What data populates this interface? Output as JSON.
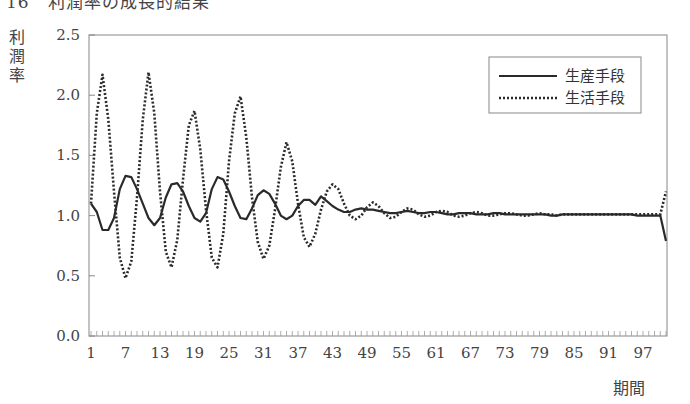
{
  "title": "16　利潤率の成長的結果",
  "chart_data": {
    "type": "line",
    "title": "利潤率の成長的結果",
    "xlabel": "期間",
    "ylabel": "利潤率",
    "ylim": [
      0.0,
      2.5
    ],
    "yticks": [
      "0.0",
      "0.5",
      "1.0",
      "1.5",
      "2.0",
      "2.5"
    ],
    "xticks": [
      "1",
      "7",
      "13",
      "19",
      "25",
      "31",
      "37",
      "43",
      "49",
      "55",
      "61",
      "67",
      "73",
      "79",
      "85",
      "91",
      "97"
    ],
    "xrange": [
      1,
      101
    ],
    "grid": false,
    "legend_position": "upper right",
    "series": [
      {
        "name": "生産手段",
        "style": "solid",
        "values": [
          1.1,
          1.03,
          0.88,
          0.88,
          0.98,
          1.22,
          1.33,
          1.32,
          1.22,
          1.1,
          0.98,
          0.92,
          0.98,
          1.15,
          1.26,
          1.27,
          1.2,
          1.08,
          0.98,
          0.95,
          1.02,
          1.22,
          1.32,
          1.3,
          1.2,
          1.08,
          0.98,
          0.97,
          1.06,
          1.17,
          1.21,
          1.18,
          1.1,
          1.0,
          0.97,
          1.0,
          1.08,
          1.13,
          1.13,
          1.09,
          1.16,
          1.12,
          1.08,
          1.05,
          1.03,
          1.03,
          1.05,
          1.06,
          1.05,
          1.05,
          1.04,
          1.03,
          1.02,
          1.02,
          1.03,
          1.04,
          1.03,
          1.02,
          1.02,
          1.03,
          1.03,
          1.02,
          1.01,
          1.01,
          1.02,
          1.02,
          1.02,
          1.01,
          1.01,
          1.01,
          1.02,
          1.02,
          1.01,
          1.01,
          1.01,
          1.01,
          1.01,
          1.01,
          1.01,
          1.01,
          1.0,
          1.0,
          1.01,
          1.01,
          1.01,
          1.01,
          1.01,
          1.01,
          1.01,
          1.01,
          1.01,
          1.01,
          1.01,
          1.01,
          1.01,
          1.0,
          1.0,
          1.0,
          1.0,
          1.0,
          0.79
        ]
      },
      {
        "name": "生活手段",
        "style": "dotted",
        "values": [
          1.1,
          1.85,
          2.17,
          1.8,
          1.2,
          0.65,
          0.48,
          0.62,
          1.15,
          1.8,
          2.19,
          1.85,
          1.2,
          0.7,
          0.57,
          0.8,
          1.3,
          1.75,
          1.87,
          1.55,
          1.05,
          0.65,
          0.57,
          0.85,
          1.45,
          1.85,
          1.99,
          1.65,
          1.15,
          0.78,
          0.64,
          0.75,
          1.05,
          1.4,
          1.61,
          1.45,
          1.1,
          0.82,
          0.74,
          0.85,
          1.05,
          1.2,
          1.26,
          1.22,
          1.1,
          1.0,
          0.97,
          1.0,
          1.07,
          1.11,
          1.08,
          1.02,
          0.98,
          0.99,
          1.03,
          1.06,
          1.05,
          1.01,
          0.99,
          1.0,
          1.03,
          1.04,
          1.03,
          1.0,
          0.99,
          1.0,
          1.02,
          1.03,
          1.02,
          1.0,
          1.0,
          1.01,
          1.02,
          1.02,
          1.01,
          1.0,
          1.0,
          1.01,
          1.02,
          1.01,
          1.01,
          1.0,
          1.01,
          1.01,
          1.01,
          1.01,
          1.01,
          1.01,
          1.01,
          1.01,
          1.01,
          1.01,
          1.01,
          1.01,
          1.01,
          1.01,
          1.01,
          1.01,
          1.01,
          1.01,
          1.2
        ]
      }
    ]
  }
}
